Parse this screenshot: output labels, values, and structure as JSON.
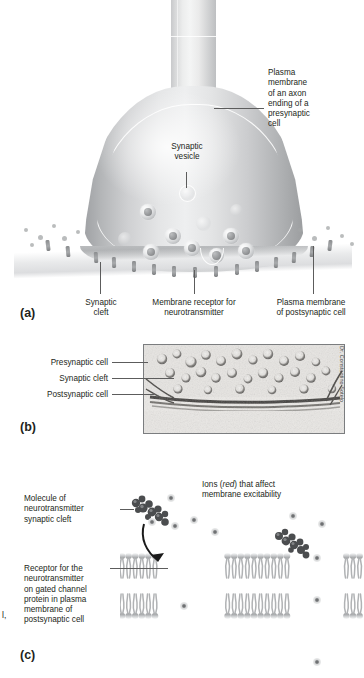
{
  "figure": {
    "panels": [
      "a",
      "b",
      "c"
    ]
  },
  "panel_a": {
    "letter": "(a)",
    "labels": {
      "plasma_membrane_axon": "Plasma\nmembrane\nof an axon\nending of a\npresynaptic\ncell",
      "plasma_membrane_axon_lines": [
        "Plasma",
        "membrane",
        "of an axon",
        "ending of a",
        "presynaptic",
        "cell"
      ],
      "synaptic_vesicle": "Synaptic\nvesicle",
      "synaptic_vesicle_lines": [
        "Synaptic",
        "vesicle"
      ],
      "synaptic_cleft": "Synaptic\ncleft",
      "synaptic_cleft_lines": [
        "Synaptic",
        "cleft"
      ],
      "membrane_receptor": "Membrane receptor for\nneurotransmitter",
      "membrane_receptor_lines": [
        "Membrane receptor for",
        "neurotransmitter"
      ],
      "plasma_membrane_post": "Plasma membrane\nof postsynaptic cell",
      "plasma_membrane_post_lines": [
        "Plasma membrane",
        "of postsynaptic cell"
      ]
    }
  },
  "panel_b": {
    "letter": "(b)",
    "labels": {
      "presynaptic_cell": "Presynaptic cell",
      "synaptic_cleft": "Synaptic cleft",
      "postsynaptic_cell": "Postsynaptic cell"
    },
    "credit": "Dr. Constantino Sotelo",
    "image_type": "electron micrograph"
  },
  "panel_c": {
    "letter": "(c)",
    "labels": {
      "molecule_of_nt": "Molecule of\nneurotransmitter\nsynaptic cleft",
      "molecule_of_nt_lines": [
        "Molecule of",
        "neurotransmitter",
        "synaptic cleft"
      ],
      "receptor_for_nt": "Receptor for the\nneurotransmitter\non gated channel\nprotein in plasma\nmembrane of\npostsynaptic cell",
      "receptor_for_nt_lines": [
        "Receptor for the",
        "neurotransmitter",
        "on gated channel",
        "protein in plasma",
        "membrane of",
        "postsynaptic cell"
      ],
      "ions_line1_pre": "Ions (",
      "ions_emphasis": "red",
      "ions_line1_post": ") that affect",
      "ions_line2": "membrane excitability"
    },
    "edge_fragment": "l,"
  },
  "colors": {
    "text": "#231f20",
    "leader_line": "#5c5c5c",
    "membrane_light": "#eceded",
    "membrane_mid": "#b9bbbd",
    "membrane_dark": "#8a8c8e",
    "background": "#ffffff"
  }
}
